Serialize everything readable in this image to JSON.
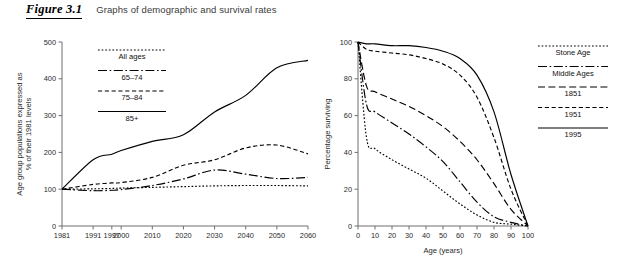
{
  "header": {
    "figure_number": "Figure 3.1",
    "caption": "Graphs of demographic and survival rates"
  },
  "chart_data": [
    {
      "id": "demographic",
      "type": "line",
      "title": "",
      "xlabel": "",
      "ylabel": "Age group populations expressed as % of their 1981 levels",
      "xlim": [
        1981,
        2060
      ],
      "ylim": [
        0,
        500
      ],
      "grid": false,
      "legend_position": "top-left",
      "xticks": [
        "1981",
        "1991",
        "1997",
        "2000",
        "2010",
        "2020",
        "2030",
        "2040",
        "2050",
        "2060"
      ],
      "xtick_values": [
        1981,
        1991,
        1997,
        2000,
        2010,
        2020,
        2030,
        2040,
        2050,
        2060
      ],
      "yticks": [
        "0",
        "100",
        "200",
        "300",
        "400",
        "500"
      ],
      "ytick_values": [
        0,
        100,
        200,
        300,
        400,
        500
      ],
      "x": [
        1981,
        1991,
        1997,
        2000,
        2010,
        2020,
        2030,
        2040,
        2050,
        2060
      ],
      "series": [
        {
          "name": "All ages",
          "style": "dotted",
          "values": [
            100,
            101,
            102,
            103,
            105,
            107,
            109,
            110,
            110,
            109
          ]
        },
        {
          "name": "65–74",
          "style": "dash-dot",
          "values": [
            100,
            96,
            97,
            99,
            110,
            128,
            152,
            141,
            129,
            132
          ]
        },
        {
          "name": "75–84",
          "style": "dashed",
          "values": [
            100,
            113,
            117,
            118,
            132,
            165,
            180,
            212,
            220,
            196
          ]
        },
        {
          "name": "85+",
          "style": "solid",
          "values": [
            100,
            180,
            195,
            205,
            230,
            248,
            310,
            355,
            430,
            450
          ]
        }
      ]
    },
    {
      "id": "survival",
      "type": "line",
      "title": "",
      "xlabel": "Age (years)",
      "ylabel": "Percentage surviving",
      "xlim": [
        0,
        100
      ],
      "ylim": [
        0,
        100
      ],
      "grid": false,
      "legend_position": "top-right",
      "xticks": [
        "0",
        "10",
        "20",
        "30",
        "40",
        "50",
        "60",
        "70",
        "80",
        "90",
        "100"
      ],
      "xtick_values": [
        0,
        10,
        20,
        30,
        40,
        50,
        60,
        70,
        80,
        90,
        100
      ],
      "yticks": [
        "0",
        "20",
        "40",
        "60",
        "80",
        "100"
      ],
      "ytick_values": [
        0,
        20,
        40,
        60,
        80,
        100
      ],
      "x": [
        0,
        5,
        10,
        20,
        30,
        40,
        50,
        60,
        70,
        80,
        90,
        100
      ],
      "series": [
        {
          "name": "Stone Age",
          "style": "dotted",
          "values": [
            100,
            48,
            42,
            36,
            31,
            26,
            19,
            12,
            6,
            2,
            1,
            0
          ]
        },
        {
          "name": "Middle Ages",
          "style": "dash-dot",
          "values": [
            100,
            66,
            62,
            56,
            50,
            43,
            35,
            24,
            13,
            5,
            2,
            0
          ]
        },
        {
          "name": "1851",
          "style": "long-dash",
          "values": [
            100,
            76,
            73,
            69,
            65,
            60,
            54,
            46,
            36,
            23,
            9,
            0
          ]
        },
        {
          "name": "1951",
          "style": "dashed",
          "values": [
            100,
            96,
            95,
            94,
            93,
            91,
            88,
            82,
            70,
            48,
            20,
            0
          ]
        },
        {
          "name": "1995",
          "style": "solid",
          "values": [
            100,
            99,
            99,
            98,
            98,
            97,
            95,
            91,
            82,
            62,
            28,
            0
          ]
        }
      ]
    }
  ],
  "legends": {
    "left": [
      {
        "label": "All ages",
        "style": "dotted"
      },
      {
        "label": "65–74",
        "style": "dash-dot"
      },
      {
        "label": "75–84",
        "style": "dashed"
      },
      {
        "label": "85+",
        "style": "solid"
      }
    ],
    "right": [
      {
        "label": "Stone Age",
        "style": "dotted"
      },
      {
        "label": "Middle Ages",
        "style": "dash-dot"
      },
      {
        "label": "1851",
        "style": "long-dash"
      },
      {
        "label": "1951",
        "style": "dashed"
      },
      {
        "label": "1995",
        "style": "solid"
      }
    ]
  }
}
